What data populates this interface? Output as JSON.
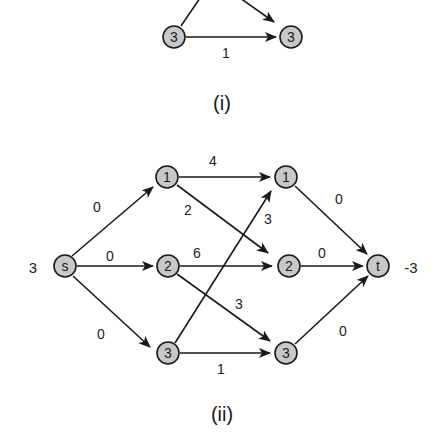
{
  "figure_i": {
    "caption": "(i)",
    "nodes": [
      {
        "id": "a",
        "label": "3",
        "x": 174,
        "y": 37
      },
      {
        "id": "b",
        "label": "3",
        "x": 291,
        "y": 37
      }
    ],
    "edges": [
      {
        "from": "a",
        "to": "b",
        "label": "1"
      }
    ]
  },
  "figure_ii": {
    "caption": "(ii)",
    "source_supply": "3",
    "sink_demand": "-3",
    "nodes": [
      {
        "id": "s",
        "label": "s",
        "x": 65,
        "y": 266
      },
      {
        "id": "1L",
        "label": "1",
        "x": 167,
        "y": 177
      },
      {
        "id": "2L",
        "label": "2",
        "x": 168,
        "y": 266
      },
      {
        "id": "3L",
        "label": "3",
        "x": 168,
        "y": 353
      },
      {
        "id": "1R",
        "label": "1",
        "x": 286,
        "y": 177
      },
      {
        "id": "2R",
        "label": "2",
        "x": 289,
        "y": 266
      },
      {
        "id": "3R",
        "label": "3",
        "x": 286,
        "y": 353
      },
      {
        "id": "t",
        "label": "t",
        "x": 378,
        "y": 266
      }
    ],
    "edges": [
      {
        "from": "s",
        "to": "1L",
        "label": "0"
      },
      {
        "from": "s",
        "to": "2L",
        "label": "0"
      },
      {
        "from": "s",
        "to": "3L",
        "label": "0"
      },
      {
        "from": "1L",
        "to": "1R",
        "label": "4"
      },
      {
        "from": "1L",
        "to": "2R",
        "label": "2"
      },
      {
        "from": "2L",
        "to": "2R",
        "label": "6"
      },
      {
        "from": "2L",
        "to": "3R",
        "label": "3"
      },
      {
        "from": "3L",
        "to": "1R",
        "label": "3"
      },
      {
        "from": "3L",
        "to": "3R",
        "label": "1"
      },
      {
        "from": "1R",
        "to": "t",
        "label": "0"
      },
      {
        "from": "2R",
        "to": "t",
        "label": "0"
      },
      {
        "from": "3R",
        "to": "t",
        "label": "0"
      }
    ]
  }
}
